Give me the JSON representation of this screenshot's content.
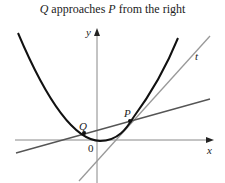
{
  "title": {
    "q": "Q",
    "mid1": " approaches ",
    "p": "P",
    "mid2": " from the right"
  },
  "labels": {
    "y_axis": "y",
    "x_axis": "x",
    "origin": "0",
    "point_q": "Q",
    "point_p": "P",
    "tangent": "t"
  },
  "colors": {
    "curve": "#111111",
    "axes": "#888888",
    "tangent": "#999999",
    "secant": "#555555"
  }
}
